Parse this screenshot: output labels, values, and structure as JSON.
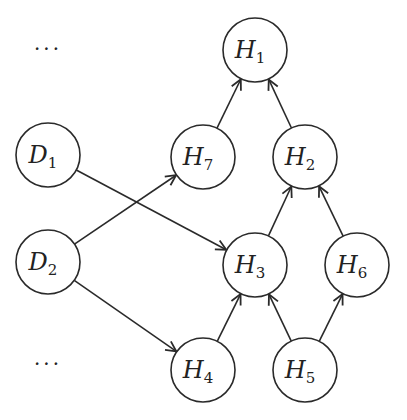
{
  "diagram": {
    "type": "directed-graph",
    "node_radius": 32,
    "stroke_color": "#2a2a2a",
    "nodes": [
      {
        "id": "H1",
        "base": "H",
        "sub": "1",
        "x": 255,
        "y": 50
      },
      {
        "id": "H7",
        "base": "H",
        "sub": "7",
        "x": 203,
        "y": 157
      },
      {
        "id": "H2",
        "base": "H",
        "sub": "2",
        "x": 305,
        "y": 157
      },
      {
        "id": "D1",
        "base": "D",
        "sub": "1",
        "x": 48,
        "y": 155
      },
      {
        "id": "D2",
        "base": "D",
        "sub": "2",
        "x": 48,
        "y": 262
      },
      {
        "id": "H3",
        "base": "H",
        "sub": "3",
        "x": 255,
        "y": 265
      },
      {
        "id": "H6",
        "base": "H",
        "sub": "6",
        "x": 357,
        "y": 265
      },
      {
        "id": "H4",
        "base": "H",
        "sub": "4",
        "x": 203,
        "y": 370
      },
      {
        "id": "H5",
        "base": "H",
        "sub": "5",
        "x": 305,
        "y": 370
      }
    ],
    "edges": [
      {
        "from": "H7",
        "to": "H1"
      },
      {
        "from": "H2",
        "to": "H1"
      },
      {
        "from": "D1",
        "to": "H3"
      },
      {
        "from": "D2",
        "to": "H7"
      },
      {
        "from": "D2",
        "to": "H4"
      },
      {
        "from": "H3",
        "to": "H2"
      },
      {
        "from": "H6",
        "to": "H2"
      },
      {
        "from": "H4",
        "to": "H3"
      },
      {
        "from": "H5",
        "to": "H3"
      },
      {
        "from": "H5",
        "to": "H6"
      }
    ],
    "ellipses": [
      {
        "text": "···",
        "x": 48,
        "y": 52
      },
      {
        "text": "···",
        "x": 48,
        "y": 367
      }
    ]
  }
}
